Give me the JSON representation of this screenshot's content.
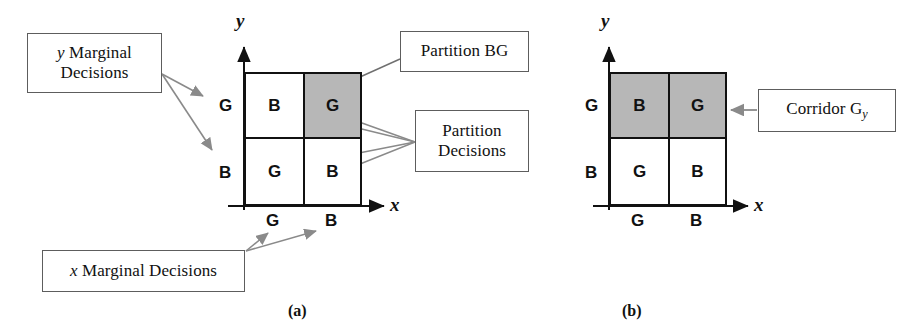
{
  "figure": {
    "caption_a": "(a)",
    "caption_b": "(b)"
  },
  "callouts": {
    "y_marginal_line1": "y",
    "y_marginal_line1_rest": " Marginal",
    "y_marginal_line2": "Decisions",
    "x_marginal_prefix": "x",
    "x_marginal_rest": " Marginal Decisions",
    "partition_bg": "Partition BG",
    "partition_decisions_line1": "Partition",
    "partition_decisions_line2": "Decisions",
    "corridor_prefix": "Corridor G",
    "corridor_subscript": "y"
  },
  "panel_a": {
    "axis_x": "x",
    "axis_y": "y",
    "y_ticks": [
      "G",
      "B"
    ],
    "x_ticks": [
      "G",
      "B"
    ],
    "cells": [
      {
        "label": "B",
        "shaded": false
      },
      {
        "label": "G",
        "shaded": true
      },
      {
        "label": "G",
        "shaded": false
      },
      {
        "label": "B",
        "shaded": false
      }
    ]
  },
  "panel_b": {
    "axis_x": "x",
    "axis_y": "y",
    "y_ticks": [
      "G",
      "B"
    ],
    "x_ticks": [
      "G",
      "B"
    ],
    "cells": [
      {
        "label": "B",
        "shaded": true
      },
      {
        "label": "G",
        "shaded": true
      },
      {
        "label": "G",
        "shaded": false
      },
      {
        "label": "B",
        "shaded": false
      }
    ]
  },
  "colors": {
    "shade": "#b7b7b7",
    "line": "#111111",
    "arrow": "#8a8a8a",
    "box_border": "#5d5d5d"
  }
}
